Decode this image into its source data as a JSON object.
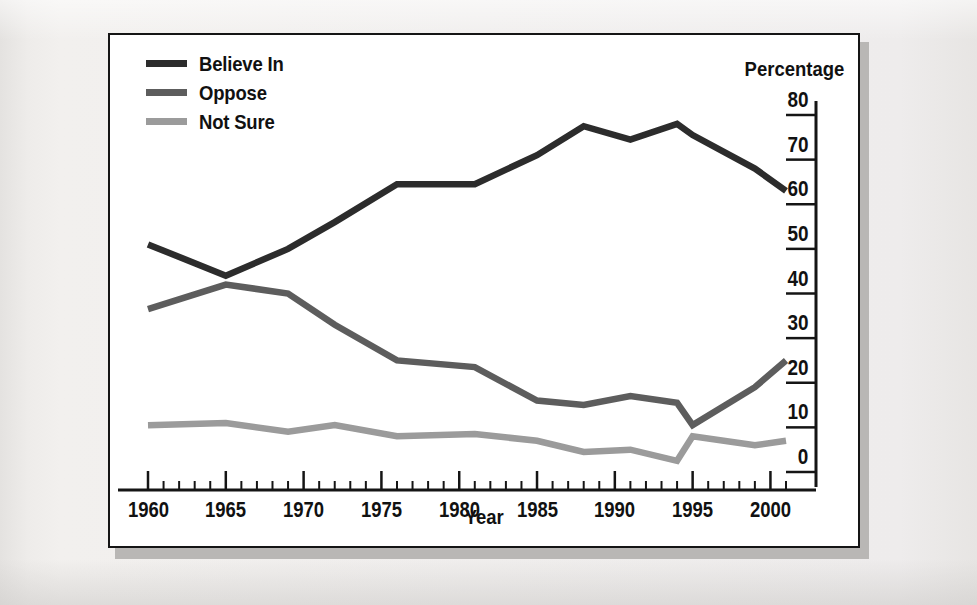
{
  "figure": {
    "percentage_axis_title": "Percentage",
    "xaxis_title": "Year"
  },
  "colors": {
    "believe_in": "#2c2c2c",
    "oppose": "#5d5d5d",
    "not_sure": "#9b9b9b",
    "axis": "#151515",
    "panel_background": "#ffffff",
    "page_background": "#efeeec",
    "shadow": "#b9b7b5"
  },
  "legend": {
    "position": "top-left",
    "items": [
      {
        "label": "Believe In",
        "color": "#2c2c2c"
      },
      {
        "label": "Oppose",
        "color": "#5d5d5d"
      },
      {
        "label": "Not Sure",
        "color": "#9b9b9b"
      }
    ]
  },
  "axes": {
    "y": {
      "title": "Percentage",
      "side": "right",
      "min": 0,
      "max": 80,
      "step": 10,
      "ticks": [
        "0",
        "10",
        "20",
        "30",
        "40",
        "50",
        "60",
        "70",
        "80"
      ],
      "label_placement": "above-tick"
    },
    "x": {
      "title": "Year",
      "min": 1960,
      "max": 2001,
      "major_step": 5,
      "minor_step": 1,
      "ticks": [
        "1960",
        "1965",
        "1970",
        "1975",
        "1980",
        "1985",
        "1990",
        "1995",
        "2000"
      ]
    }
  },
  "chart_data": {
    "type": "line",
    "title": "",
    "subtitle": "",
    "xlabel": "Year",
    "ylabel": "Percentage",
    "xlim": [
      1960,
      2001
    ],
    "ylim": [
      0,
      80
    ],
    "grid": false,
    "legend_position": "top-left",
    "x": [
      1960,
      1965,
      1969,
      1972,
      1976,
      1981,
      1985,
      1988,
      1991,
      1994,
      1995,
      1999,
      2001
    ],
    "series": [
      {
        "name": "Believe In",
        "color": "#2c2c2c",
        "values": [
          51,
          44,
          50,
          56,
          64.5,
          64.5,
          71,
          77.5,
          74.5,
          78,
          75.5,
          68,
          63
        ]
      },
      {
        "name": "Oppose",
        "color": "#5d5d5d",
        "values": [
          36.5,
          42,
          40,
          33,
          25,
          23.5,
          16,
          15,
          17,
          15.5,
          10.5,
          19,
          25
        ]
      },
      {
        "name": "Not Sure",
        "color": "#9b9b9b",
        "values": [
          10.5,
          11,
          9,
          10.5,
          8,
          8.5,
          7,
          4.5,
          5,
          2.5,
          8,
          6,
          7
        ]
      }
    ]
  }
}
